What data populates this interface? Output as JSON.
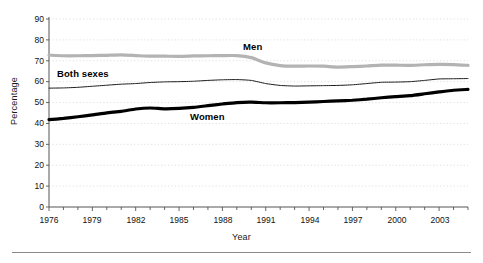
{
  "chart_data": {
    "type": "line",
    "title": "",
    "xlabel": "Year",
    "ylabel": "Percentage",
    "xlim": [
      1976,
      2005
    ],
    "ylim": [
      0,
      90
    ],
    "ytick_step": 10,
    "grid": true,
    "grid_style": "dotted-horizontal",
    "legend_position": "inline-annotations",
    "x": [
      1976,
      1977,
      1978,
      1979,
      1980,
      1981,
      1982,
      1983,
      1984,
      1985,
      1986,
      1987,
      1988,
      1989,
      1990,
      1991,
      1992,
      1993,
      1994,
      1995,
      1996,
      1997,
      1998,
      1999,
      2000,
      2001,
      2002,
      2003,
      2004,
      2005
    ],
    "xticklabels": [
      "1976",
      "1979",
      "1982",
      "1985",
      "1988",
      "1991",
      "1994",
      "1997",
      "2000",
      "2003"
    ],
    "xticklabel_years": [
      1976,
      1979,
      1982,
      1985,
      1988,
      1991,
      1994,
      1997,
      2000,
      2003
    ],
    "yticklabels": [
      "0",
      "10",
      "20",
      "30",
      "40",
      "50",
      "60",
      "70",
      "80",
      "90"
    ],
    "series": [
      {
        "name": "Men",
        "label": "Men",
        "color": "#b3b3b3",
        "width": 3.2,
        "values": [
          72.7,
          72.4,
          72.4,
          72.5,
          72.6,
          72.8,
          72.5,
          72.2,
          72.2,
          72.1,
          72.3,
          72.4,
          72.5,
          72.5,
          71.5,
          69.0,
          67.7,
          67.4,
          67.5,
          67.4,
          67.0,
          67.2,
          67.5,
          67.9,
          67.9,
          67.8,
          68.1,
          68.3,
          68.2,
          67.8
        ]
      },
      {
        "name": "Both sexes",
        "label": "Both sexes",
        "color": "#1a1a1a",
        "width": 1.0,
        "values": [
          56.9,
          57.0,
          57.3,
          57.8,
          58.3,
          58.8,
          59.1,
          59.6,
          59.9,
          60.0,
          60.2,
          60.6,
          60.9,
          61.0,
          60.6,
          59.1,
          58.2,
          57.9,
          58.0,
          58.1,
          58.2,
          58.5,
          59.1,
          59.7,
          59.8,
          60.0,
          60.6,
          61.3,
          61.4,
          61.5
        ]
      },
      {
        "name": "Women",
        "label": "Women",
        "color": "#000000",
        "width": 3.2,
        "values": [
          41.8,
          42.4,
          43.2,
          44.1,
          45.1,
          45.8,
          46.9,
          47.4,
          47.0,
          47.2,
          47.7,
          48.5,
          49.3,
          50.0,
          50.2,
          49.9,
          49.9,
          50.0,
          50.2,
          50.5,
          50.8,
          51.1,
          51.6,
          52.3,
          52.8,
          53.3,
          54.2,
          55.1,
          55.9,
          56.3
        ]
      }
    ],
    "annotations": [
      {
        "text": "Men",
        "near_series": "Men"
      },
      {
        "text": "Both sexes",
        "near_series": "Both sexes"
      },
      {
        "text": "Women",
        "near_series": "Women"
      }
    ]
  }
}
